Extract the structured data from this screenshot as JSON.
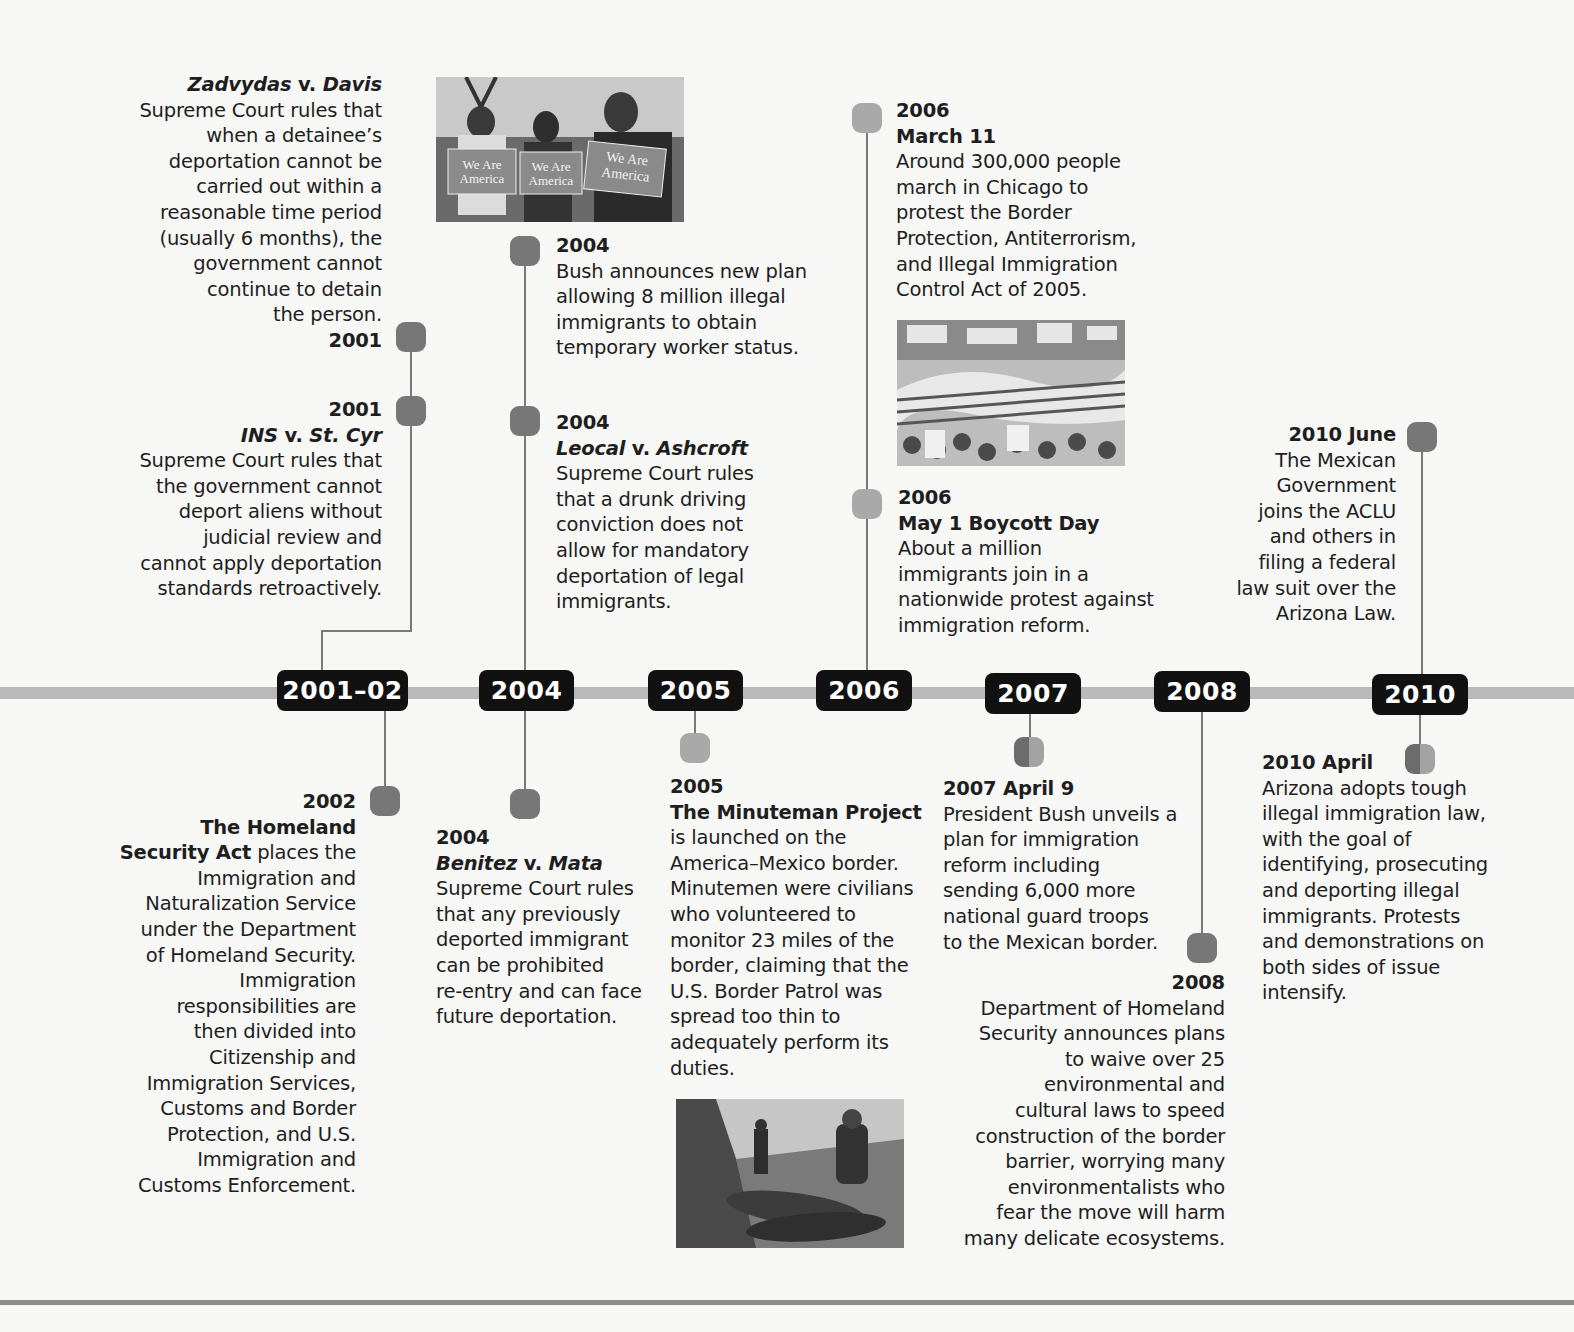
{
  "timeline": {
    "year_markers": [
      "2001–02",
      "2004",
      "2005",
      "2006",
      "2007",
      "2008",
      "2010"
    ],
    "events": {
      "zadvydas": {
        "case_name_italic_1": "Zadvydas",
        "case_name_mid": " v. ",
        "case_name_italic_2": "Davis",
        "lines": [
          "Supreme Court rules that",
          "when a detainee’s",
          "deportation cannot be",
          "carried out within a",
          "reasonable time period",
          "(usually 6 months), the",
          "government cannot",
          "continue to detain",
          "the person."
        ],
        "date": "2001"
      },
      "ins_v_st_cyr": {
        "date": "2001",
        "case_name_italic_1": "INS",
        "case_name_mid": " v. ",
        "case_name_italic_2": "St. Cyr",
        "lines": [
          "Supreme Court rules that",
          "the government cannot",
          "deport aliens without",
          "judicial review and",
          "cannot apply deportation",
          "standards retroactively."
        ]
      },
      "bush_plan_2004": {
        "date": "2004",
        "lines": [
          "Bush announces new plan",
          "allowing 8 million illegal",
          "immigrants to obtain",
          "temporary worker status."
        ]
      },
      "leocal": {
        "date": "2004",
        "case_name_italic_1": "Leocal",
        "case_name_mid": " v. ",
        "case_name_italic_2": "Ashcroft",
        "lines": [
          "Supreme Court rules",
          "that a drunk driving",
          "conviction does not",
          "allow for mandatory",
          "deportation of legal",
          "immigrants."
        ]
      },
      "march_2006": {
        "date": "2006",
        "title": "March 11",
        "lines": [
          "Around 300,000 people",
          "march in Chicago to",
          "protest the Border",
          "Protection, Antiterrorism,",
          "and Illegal Immigration",
          "Control Act of 2005."
        ]
      },
      "boycott_2006": {
        "date": "2006",
        "title": "May 1 Boycott Day",
        "lines": [
          "About a million",
          "immigrants join in a",
          "nationwide protest against",
          "immigration reform."
        ]
      },
      "june_2010": {
        "date": "2010 June",
        "lines": [
          "The Mexican",
          "Government",
          "joins the ACLU",
          "and others in",
          "filing a federal",
          "law suit over the",
          "Arizona Law."
        ]
      },
      "homeland_2002": {
        "date": "2002",
        "title_line_1": "The Homeland",
        "title_line_2_bold": "Security Act",
        "title_line_2_rest": " places the",
        "lines": [
          "Immigration and",
          "Naturalization Service",
          "under the Department",
          "of Homeland Security.",
          "Immigration",
          "responsibilities are",
          "then divided into",
          "Citizenship and",
          "Immigration Services,",
          "Customs and Border",
          "Protection, and U.S.",
          "Immigration and",
          "Customs Enforcement."
        ]
      },
      "benitez": {
        "date": "2004",
        "case_name_italic_1": "Benitez",
        "case_name_mid": " v. ",
        "case_name_italic_2": "Mata",
        "lines": [
          "Supreme Court rules",
          "that any previously",
          "deported immigrant",
          "can be prohibited",
          "re-entry and can face",
          "future deportation."
        ]
      },
      "minuteman_2005": {
        "date": "2005",
        "title": "The Minuteman Project",
        "lines": [
          "is launched on the",
          "America–Mexico border.",
          "Minutemen were civilians",
          "who volunteered to",
          "monitor 23 miles of the",
          "border, claiming that the",
          "U.S. Border Patrol was",
          "spread too thin to",
          "adequately perform its",
          "duties."
        ]
      },
      "april_2007": {
        "date": "2007 April 9",
        "lines": [
          "President Bush unveils a",
          "plan for immigration",
          "reform including",
          "sending 6,000 more",
          "national guard troops",
          "to the Mexican border."
        ]
      },
      "dhs_2008": {
        "date": "2008",
        "lines": [
          "Department of Homeland",
          "Security announces plans",
          "to waive over 25",
          "environmental and",
          "cultural laws to speed",
          "construction of the border",
          "barrier, worrying many",
          "environmentalists who",
          "fear the move will harm",
          "many delicate ecosystems."
        ]
      },
      "arizona_2010": {
        "date": "2010 April",
        "lines": [
          "Arizona adopts tough",
          "illegal immigration law,",
          "with the goal of",
          "identifying, prosecuting",
          "and deporting illegal",
          "immigrants. Protests",
          "and demonstrations on",
          "both sides of issue",
          "intensify."
        ]
      }
    },
    "photos": {
      "we_are_america": {
        "sign_text_1": "We Are",
        "sign_text_2": "America"
      },
      "chicago_march": {},
      "border_patrol": {}
    },
    "colors": {
      "node_dark": "#777777",
      "node_light": "#a9a9a9",
      "axis": "#b9b9b9",
      "year_box": "#111111",
      "text": "#1e1e1e"
    }
  }
}
